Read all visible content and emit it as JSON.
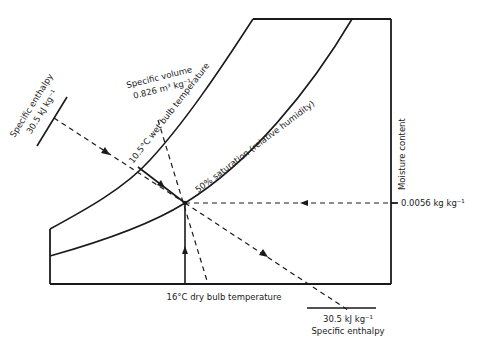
{
  "diagram": {
    "state_point": {
      "dry_bulb": "16°C",
      "wet_bulb": "10.5°C",
      "relative_humidity": "50%"
    },
    "labels": {
      "specific_enthalpy_top_title": "Specific enthalpy",
      "specific_enthalpy_top_value": "30.5 kJ kg⁻¹",
      "specific_volume_title": "Specific volume",
      "specific_volume_value": "0.826 m³ kg⁻¹",
      "wet_bulb": "10.5°C wet bulb temperature",
      "saturation_curve": "50% saturation (relative humidity)",
      "moisture_content_axis": "Moisture content",
      "moisture_content_value": "0.0056 kg kg⁻¹",
      "dry_bulb": "16°C dry bulb temperature",
      "specific_enthalpy_bottom_value": "30.5 kJ kg⁻¹",
      "specific_enthalpy_bottom_title": "Specific enthalpy"
    },
    "colors": {
      "line": "#1a1a1a",
      "background": "#ffffff"
    }
  }
}
